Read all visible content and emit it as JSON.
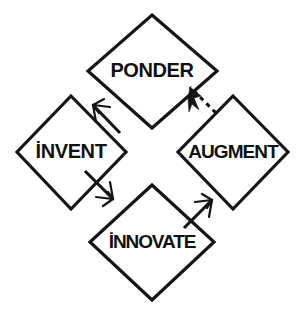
{
  "diagram": {
    "background_color": "#ffffff",
    "stroke_color": "#151515",
    "nodes": [
      {
        "id": "ponder",
        "label": "PONDER",
        "position": "top",
        "center_x": 152,
        "center_y": 71,
        "half_width": 65,
        "half_height": 57,
        "shape": "diamond"
      },
      {
        "id": "invent",
        "label": "İNVENT",
        "position": "left",
        "center_x": 71,
        "center_y": 152,
        "half_width": 55,
        "half_height": 57,
        "shape": "diamond"
      },
      {
        "id": "innovate",
        "label": "İNNOVATE",
        "position": "bottom",
        "center_x": 152,
        "center_y": 242,
        "half_width": 62,
        "half_height": 58,
        "shape": "diamond"
      },
      {
        "id": "augment",
        "label": "AUGMENT",
        "position": "right",
        "center_x": 233,
        "center_y": 152,
        "half_width": 56,
        "half_height": 57,
        "shape": "diamond"
      }
    ],
    "edges": [
      {
        "id": "ponder-to-invent",
        "from": "ponder",
        "to": "invent",
        "style": "solid",
        "arrowhead": "barbed",
        "direction": "down-left"
      },
      {
        "id": "invent-to-innovate",
        "from": "invent",
        "to": "innovate",
        "style": "solid",
        "arrowhead": "barbed",
        "direction": "down-right"
      },
      {
        "id": "innovate-to-augment",
        "from": "innovate",
        "to": "augment",
        "style": "solid",
        "arrowhead": "barbed",
        "direction": "up-right"
      },
      {
        "id": "augment-to-ponder",
        "from": "augment",
        "to": "ponder",
        "style": "dashed",
        "arrowhead": "solid-triangle",
        "direction": "up-left"
      }
    ]
  }
}
